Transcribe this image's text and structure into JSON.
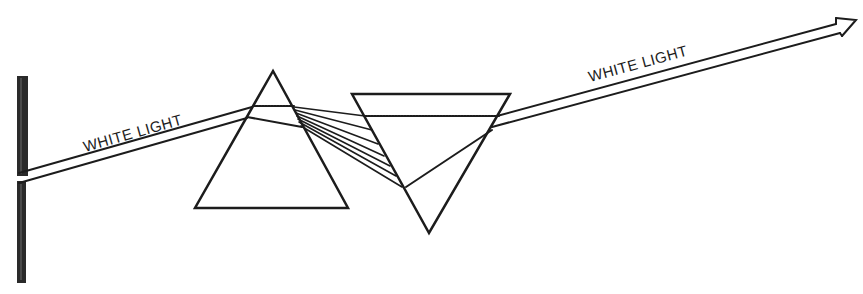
{
  "diagram": {
    "title": "",
    "labels": {
      "incoming_beam": "WHITE LIGHT",
      "outgoing_beam": "WHITE LIGHT"
    },
    "elements": [
      {
        "id": "screen-wall",
        "type": "vertical-bar"
      },
      {
        "id": "prism-1",
        "type": "triangle",
        "orientation": "apex-up"
      },
      {
        "id": "prism-2",
        "type": "triangle",
        "orientation": "apex-down"
      },
      {
        "id": "dispersed-rays",
        "type": "ray-fan",
        "count": 7
      }
    ],
    "colors": {
      "stroke": "#1c1c1c",
      "background": "#ffffff"
    }
  }
}
